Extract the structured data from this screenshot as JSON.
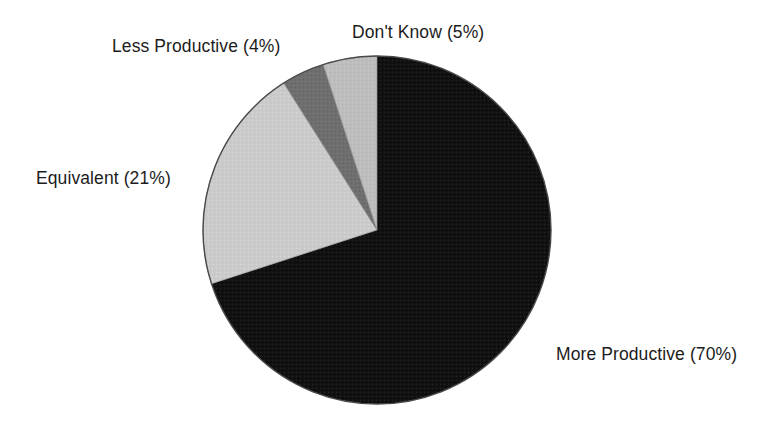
{
  "chart_data": {
    "type": "pie",
    "title": "",
    "subtitle": "",
    "xlabel": "",
    "ylabel": "",
    "legend_position": "none",
    "grid": false,
    "labels_placement": "outside-callout",
    "start_angle_deg": 90,
    "direction": "clockwise",
    "categories": [
      "More Productive",
      "Equivalent",
      "Less Productive",
      "Don't Know"
    ],
    "values": [
      70,
      21,
      4,
      5
    ],
    "value_unit": "%",
    "slices": [
      {
        "name": "more-productive",
        "label": "More Productive (70%)",
        "category": "More Productive",
        "value": 70,
        "percent_text": "(70%)",
        "color": "#121212"
      },
      {
        "name": "equivalent",
        "label": "Equivalent (21%)",
        "category": "Equivalent",
        "value": 21,
        "percent_text": "(21%)",
        "color": "#cbcbcb"
      },
      {
        "name": "less-productive",
        "label": "Less Productive (4%)",
        "category": "Less Productive",
        "value": 4,
        "percent_text": "(4%)",
        "color": "#6e6e6e"
      },
      {
        "name": "dont-know",
        "label": "Don't Know (5%)",
        "category": "Don't Know",
        "value": 5,
        "percent_text": "(5%)",
        "color": "#bdbdbd"
      }
    ],
    "geometry": {
      "center_x": 377,
      "center_y": 230,
      "radius": 174,
      "outline_color": "#444444"
    },
    "background_color": "#ffffff",
    "text_color": "#1c1c1c"
  }
}
